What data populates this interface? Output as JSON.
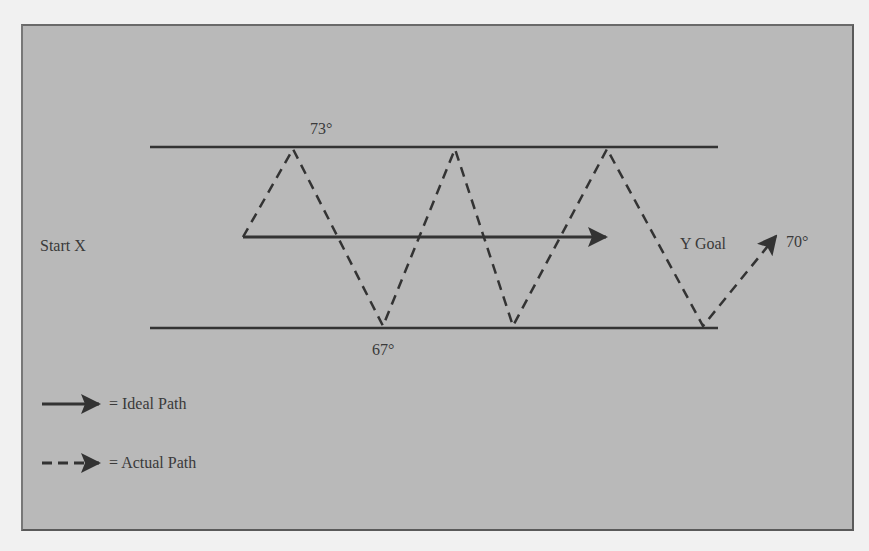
{
  "diagram": {
    "labels": {
      "start": "Start X",
      "goal": "Y Goal",
      "upper_temp": "73°",
      "lower_temp": "67°",
      "final_temp": "70°"
    },
    "legend": [
      {
        "style": "solid",
        "label": "= Ideal Path"
      },
      {
        "style": "dashed",
        "label": "= Actual Path"
      }
    ],
    "colors": {
      "background": "#b9b9b9",
      "line": "#333333",
      "text": "#3a3a3a"
    },
    "geometry": {
      "upper_bound": {
        "x1": 150,
        "x2": 718,
        "y": 147
      },
      "lower_bound": {
        "x1": 150,
        "x2": 718,
        "y": 328
      },
      "ideal_path": {
        "x1": 243,
        "y": 237,
        "x2": 606
      },
      "actual_path_points": [
        [
          243,
          237
        ],
        [
          293,
          149
        ],
        [
          383,
          326
        ],
        [
          455,
          149
        ],
        [
          513,
          326
        ],
        [
          607,
          149
        ],
        [
          703,
          326
        ],
        [
          776,
          236
        ]
      ]
    }
  }
}
